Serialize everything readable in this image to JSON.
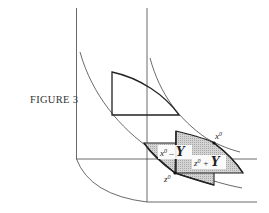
{
  "figure": {
    "caption": "FIGURE 3",
    "labels": {
      "x0": "x",
      "x0_sup": "0",
      "z0": "z",
      "z0_sup": "0",
      "x0_minus_Y": {
        "base": "x",
        "sup": "0",
        "op": " – ",
        "set": "Y"
      },
      "z0_plus_Y": {
        "base": "z",
        "sup": "0",
        "op": " + ",
        "set": "Y"
      }
    }
  },
  "colors": {
    "line": "#333333",
    "thick_line": "#222222",
    "hatch_fill": "#c8c8c8",
    "label_bg": "#ffffff"
  }
}
